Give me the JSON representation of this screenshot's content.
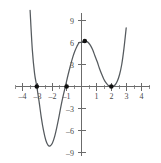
{
  "chart_data": {
    "type": "line",
    "title": "",
    "subtitle": "",
    "xlabel": "",
    "ylabel": "",
    "xlim": [
      -4.6,
      4.6
    ],
    "ylim": [
      -10.2,
      10.2
    ],
    "grid": false,
    "legend": null,
    "x_ticks": [
      -4,
      -3,
      -2,
      -1,
      1,
      2,
      3,
      4
    ],
    "x_tick_labels": [
      "–4",
      "–3",
      "–2",
      "–1",
      "1",
      "2",
      "3",
      "4"
    ],
    "y_ticks": [
      -9,
      -6,
      -3,
      3,
      6,
      9
    ],
    "y_tick_labels": [
      "–9",
      "–6",
      "–3",
      "3",
      "6",
      "9"
    ],
    "minor_x_ticks": [
      -4.5,
      -3.5,
      -2.5,
      -1.5,
      -0.5,
      0.5,
      1.5,
      2.5,
      3.5,
      4.5
    ],
    "curve_color": "#555a5e",
    "axis_color": "#6b6b6b",
    "point_color": "#111111",
    "series": [
      {
        "name": "quartic",
        "equation": "y = -0.333 (x + 3)(x + 1)(x - 2)^2",
        "x": [
          -3.45,
          -3.3,
          -3.15,
          -3.0,
          -2.85,
          -2.7,
          -2.55,
          -2.4,
          -2.25,
          -2.1,
          -1.95,
          -1.8,
          -1.65,
          -1.5,
          -1.35,
          -1.2,
          -1.05,
          -0.9,
          -0.75,
          -0.6,
          -0.45,
          -0.3,
          -0.15,
          0.0,
          0.15,
          0.3,
          0.45,
          0.6,
          0.75,
          0.9,
          1.05,
          1.2,
          1.35,
          1.5,
          1.65,
          1.8,
          1.95,
          2.1,
          2.25,
          2.4,
          2.55,
          2.7,
          2.85,
          3.0
        ],
        "y": [
          10.4,
          5.0,
          1.8,
          0.0,
          -2.0,
          -4.2,
          -6.0,
          -7.3,
          -8.0,
          -8.1,
          -7.7,
          -6.8,
          -5.5,
          -4.0,
          -2.4,
          -1.0,
          0.3,
          1.6,
          2.8,
          3.9,
          4.8,
          5.5,
          6.0,
          6.0,
          6.2,
          6.2,
          6.0,
          5.6,
          5.0,
          4.2,
          3.4,
          2.5,
          1.7,
          1.0,
          0.5,
          0.15,
          0.0,
          0.0,
          0.2,
          0.7,
          1.6,
          3.0,
          5.2,
          8.0
        ]
      }
    ],
    "marked_points": [
      {
        "label": "root",
        "x": -3,
        "y": 0
      },
      {
        "label": "root",
        "x": -1,
        "y": 0
      },
      {
        "label": "local-maximum",
        "x": 0.22,
        "y": 6.2
      },
      {
        "label": "double-root",
        "x": 2,
        "y": 0
      }
    ],
    "annotations": []
  }
}
